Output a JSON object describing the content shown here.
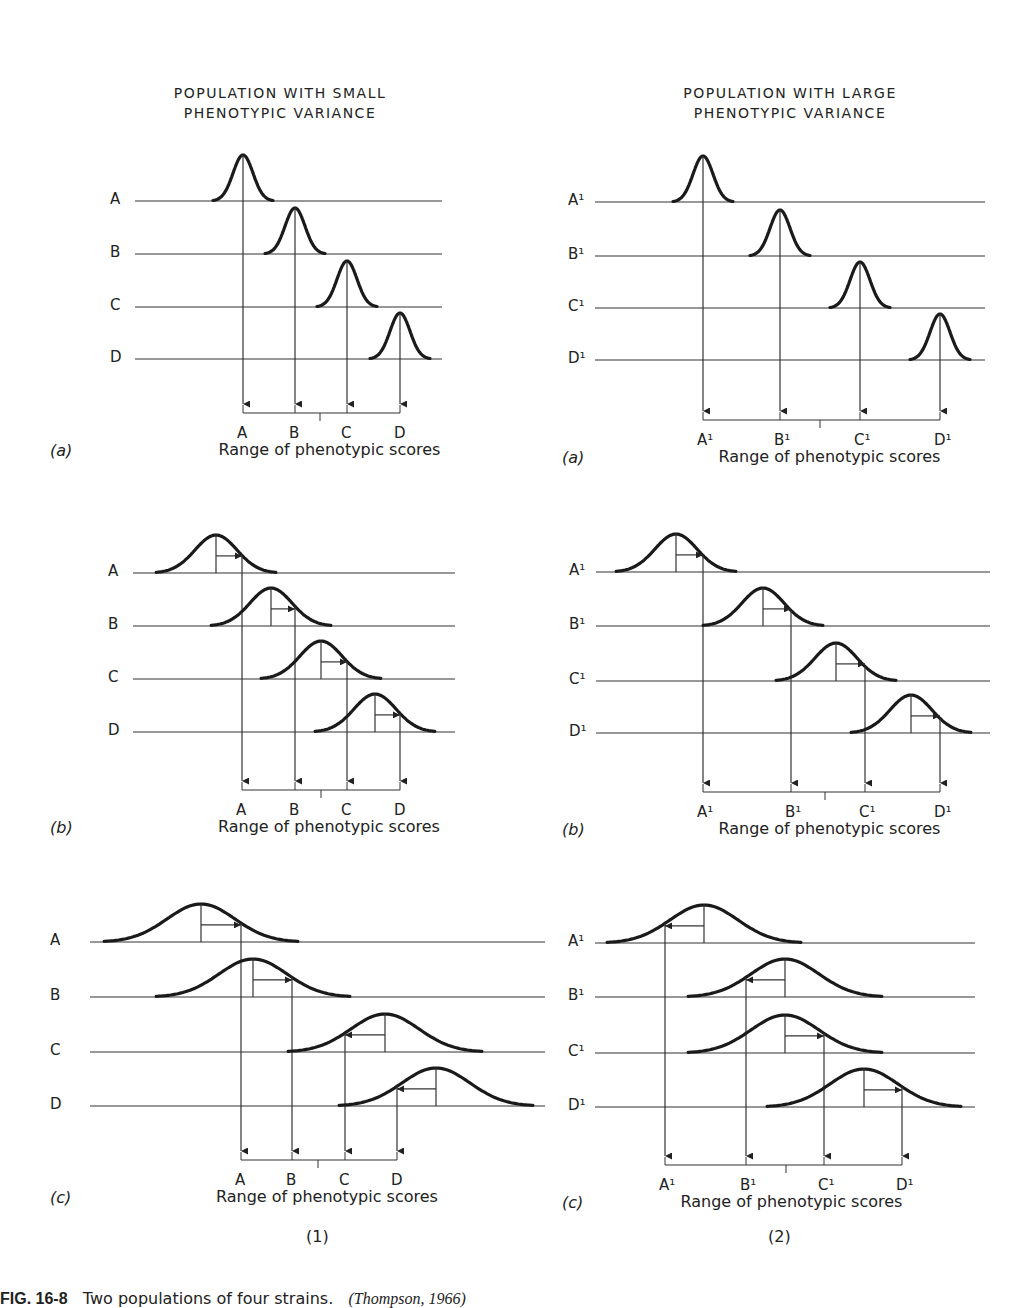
{
  "columns": [
    {
      "id": "1",
      "title_line1": "POPULATION WITH SMALL",
      "title_line2": "PHENOTYPIC VARIANCE",
      "label": "(1)",
      "row_labels": [
        "A",
        "B",
        "C",
        "D"
      ],
      "axis_labels": [
        "A",
        "B",
        "C",
        "D"
      ],
      "panels": [
        {
          "id": "a",
          "label": "(a)",
          "axis_title": "Range of phenotypic scores",
          "baselines": [
            201,
            254,
            307,
            359
          ],
          "line_x": [
            135,
            442
          ],
          "sigma": 10,
          "peaks": [
            243,
            295,
            347,
            400
          ],
          "arrow_to": [
            243,
            295,
            347,
            400
          ],
          "axis_y": 413,
          "axis_mid": 320
        },
        {
          "id": "b",
          "label": "(b)",
          "axis_title": "Range of phenotypic scores",
          "baselines": [
            573,
            626,
            679,
            732
          ],
          "line_x": [
            133,
            455
          ],
          "sigma": 21,
          "peaks": [
            216,
            271,
            321,
            375
          ],
          "arrow_to": [
            242,
            295,
            347,
            400
          ],
          "axis_y": 790,
          "axis_mid": 321
        },
        {
          "id": "c",
          "label": "(c)",
          "axis_title": "Range of phenotypic scores",
          "baselines": [
            942,
            997,
            1052,
            1106
          ],
          "line_x": [
            90,
            545
          ],
          "sigma": 34,
          "peaks": [
            201,
            253,
            385,
            436
          ],
          "arrow_to": [
            241,
            292,
            345,
            397
          ],
          "axis_y": 1160,
          "axis_mid": 318
        }
      ]
    },
    {
      "id": "2",
      "title_line1": "POPULATION WITH LARGE",
      "title_line2": "PHENOTYPIC VARIANCE",
      "label": "(2)",
      "row_labels": [
        "A¹",
        "B¹",
        "C¹",
        "D¹"
      ],
      "axis_labels": [
        "A¹",
        "B¹",
        "C¹",
        "D¹"
      ],
      "panels": [
        {
          "id": "a",
          "label": "(a)",
          "axis_title": "Range of phenotypic scores",
          "baselines": [
            202,
            256,
            308,
            360
          ],
          "line_x": [
            595,
            985
          ],
          "sigma": 10,
          "peaks": [
            703,
            780,
            860,
            940
          ],
          "arrow_to": [
            703,
            780,
            860,
            940
          ],
          "axis_y": 420,
          "axis_mid": 820
        },
        {
          "id": "b",
          "label": "(b)",
          "axis_title": "Range of phenotypic scores",
          "baselines": [
            572,
            626,
            681,
            733
          ],
          "line_x": [
            596,
            990
          ],
          "sigma": 21,
          "peaks": [
            676,
            763,
            836,
            911
          ],
          "arrow_to": [
            703,
            791,
            865,
            940
          ],
          "axis_y": 792,
          "axis_mid": 825
        },
        {
          "id": "c",
          "label": "(c)",
          "axis_title": "Range of phenotypic scores",
          "baselines": [
            943,
            997,
            1053,
            1107
          ],
          "line_x": [
            595,
            975
          ],
          "sigma": 34,
          "peaks": [
            704,
            785,
            785,
            864
          ],
          "arrow_to": [
            665,
            746,
            824,
            902
          ],
          "axis_y": 1165,
          "axis_mid": 786
        }
      ]
    }
  ],
  "caption": {
    "fig_label": "FIG. 16-8",
    "text": "Two populations of four strains.",
    "source": "(Thompson, 1966)"
  }
}
